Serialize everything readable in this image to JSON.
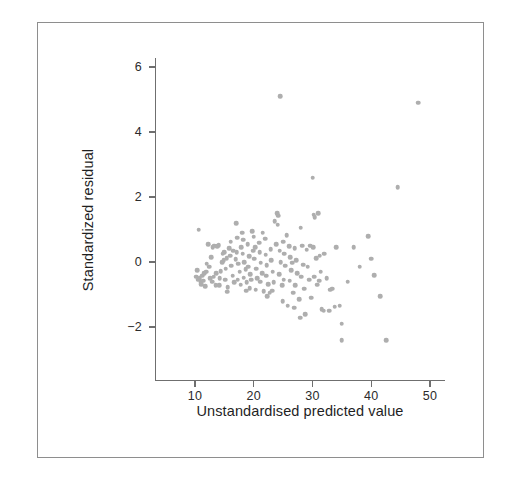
{
  "figure": {
    "frame_color": "#8e8e8e",
    "background": "#ffffff"
  },
  "chart_data": {
    "type": "scatter",
    "title": "",
    "xlabel": "Unstandardised predicted value",
    "ylabel": "Standardized residual",
    "xlim": [
      4.5,
      53
    ],
    "ylim": [
      -3.2,
      6.6
    ],
    "xticks": [
      10,
      20,
      30,
      40,
      50
    ],
    "yticks": [
      -2,
      0,
      2,
      4,
      6
    ],
    "xtick_labels": [
      "10",
      "20",
      "30",
      "40",
      "50"
    ],
    "ytick_labels": [
      "-2",
      "0",
      "2",
      "4",
      "6"
    ],
    "grid": false,
    "legend": null,
    "marker": {
      "shape": "circle",
      "color": "#aeaeae",
      "size_px": 4.6
    },
    "series": [
      {
        "name": "residuals",
        "n_points": 163,
        "points": [
          [
            10.6,
            1.0
          ],
          [
            10.4,
            -0.25
          ],
          [
            10.2,
            -0.45
          ],
          [
            10.5,
            -0.55
          ],
          [
            10.8,
            -0.5
          ],
          [
            11.0,
            -0.62
          ],
          [
            11.2,
            -0.42
          ],
          [
            11.4,
            -0.58
          ],
          [
            11.6,
            -0.35
          ],
          [
            11.1,
            -0.68
          ],
          [
            11.9,
            -0.3
          ],
          [
            12.2,
            0.55
          ],
          [
            12.4,
            -0.15
          ],
          [
            12.0,
            -0.05
          ],
          [
            12.6,
            -0.5
          ],
          [
            12.8,
            0.15
          ],
          [
            13.0,
            0.45
          ],
          [
            13.3,
            0.5
          ],
          [
            13.2,
            -0.45
          ],
          [
            13.6,
            -0.35
          ],
          [
            13.8,
            0.48
          ],
          [
            14.0,
            0.52
          ],
          [
            14.2,
            -0.5
          ],
          [
            14.4,
            -0.28
          ],
          [
            14.6,
            0.0
          ],
          [
            14.1,
            -0.72
          ],
          [
            14.9,
            0.05
          ],
          [
            15.0,
            0.3
          ],
          [
            15.2,
            -0.2
          ],
          [
            15.4,
            0.12
          ],
          [
            15.1,
            -0.55
          ],
          [
            15.6,
            -0.78
          ],
          [
            15.8,
            0.42
          ],
          [
            16.0,
            0.2
          ],
          [
            16.2,
            -0.12
          ],
          [
            16.4,
            -0.42
          ],
          [
            16.1,
            0.62
          ],
          [
            16.7,
            -0.62
          ],
          [
            16.9,
            0.08
          ],
          [
            17.0,
            1.2
          ],
          [
            17.2,
            0.75
          ],
          [
            17.1,
            0.3
          ],
          [
            17.4,
            -0.05
          ],
          [
            17.6,
            -0.3
          ],
          [
            17.3,
            -0.55
          ],
          [
            17.8,
            -0.7
          ],
          [
            18.0,
            0.9
          ],
          [
            18.2,
            0.68
          ],
          [
            18.1,
            0.25
          ],
          [
            18.4,
            0.0
          ],
          [
            18.6,
            -0.22
          ],
          [
            18.3,
            -0.48
          ],
          [
            18.8,
            -0.62
          ],
          [
            19.0,
            0.55
          ],
          [
            19.2,
            0.18
          ],
          [
            19.1,
            -0.15
          ],
          [
            19.4,
            -0.38
          ],
          [
            19.6,
            -0.55
          ],
          [
            19.3,
            -0.8
          ],
          [
            19.9,
            0.35
          ],
          [
            20.0,
            0.78
          ],
          [
            20.2,
            0.45
          ],
          [
            20.1,
            0.1
          ],
          [
            20.4,
            -0.2
          ],
          [
            20.6,
            -0.5
          ],
          [
            20.3,
            -0.85
          ],
          [
            20.9,
            0.6
          ],
          [
            21.0,
            0.3
          ],
          [
            21.2,
            -0.02
          ],
          [
            21.4,
            -0.35
          ],
          [
            21.1,
            -0.6
          ],
          [
            21.7,
            -0.9
          ],
          [
            21.9,
            0.72
          ],
          [
            22.0,
            0.22
          ],
          [
            22.2,
            -0.1
          ],
          [
            22.1,
            -0.42
          ],
          [
            22.5,
            -0.68
          ],
          [
            22.7,
            -0.95
          ],
          [
            22.9,
            0.4
          ],
          [
            23.0,
            0.05
          ],
          [
            23.2,
            -0.3
          ],
          [
            23.4,
            -0.62
          ],
          [
            23.1,
            -0.88
          ],
          [
            23.8,
            0.55
          ],
          [
            24.0,
            1.5
          ],
          [
            24.2,
            1.42
          ],
          [
            24.1,
            1.15
          ],
          [
            24.4,
            0.35
          ],
          [
            24.6,
            0.0
          ],
          [
            24.3,
            -0.38
          ],
          [
            24.8,
            -0.72
          ],
          [
            24.5,
            5.1
          ],
          [
            25.0,
            0.62
          ],
          [
            25.2,
            0.25
          ],
          [
            25.4,
            -0.12
          ],
          [
            25.1,
            -0.55
          ],
          [
            25.8,
            -1.35
          ],
          [
            26.0,
            0.48
          ],
          [
            26.2,
            0.15
          ],
          [
            26.4,
            -0.25
          ],
          [
            26.1,
            -0.58
          ],
          [
            26.7,
            -0.95
          ],
          [
            26.9,
            -1.4
          ],
          [
            27.0,
            0.42
          ],
          [
            27.2,
            0.05
          ],
          [
            27.4,
            -0.35
          ],
          [
            27.1,
            -0.72
          ],
          [
            27.7,
            -1.15
          ],
          [
            27.9,
            -1.72
          ],
          [
            28.0,
            1.05
          ],
          [
            28.2,
            0.5
          ],
          [
            28.4,
            -0.08
          ],
          [
            28.1,
            -0.45
          ],
          [
            28.6,
            -0.82
          ],
          [
            28.8,
            -1.6
          ],
          [
            29.0,
            0.38
          ],
          [
            29.2,
            -0.15
          ],
          [
            29.4,
            -0.55
          ],
          [
            29.8,
            -1.1
          ],
          [
            30.0,
            2.6
          ],
          [
            30.2,
            1.45
          ],
          [
            30.4,
            1.38
          ],
          [
            30.1,
            0.45
          ],
          [
            30.6,
            0.12
          ],
          [
            30.3,
            -0.45
          ],
          [
            30.8,
            -0.7
          ],
          [
            31.0,
            1.5
          ],
          [
            31.2,
            0.2
          ],
          [
            31.4,
            -0.3
          ],
          [
            31.1,
            -0.58
          ],
          [
            31.6,
            -1.45
          ],
          [
            31.9,
            -1.5
          ],
          [
            32.0,
            0.25
          ],
          [
            32.4,
            -0.5
          ],
          [
            32.8,
            -1.5
          ],
          [
            33.0,
            -0.85
          ],
          [
            33.4,
            -0.82
          ],
          [
            34.0,
            0.45
          ],
          [
            34.6,
            -1.35
          ],
          [
            35.0,
            -1.9
          ],
          [
            35.0,
            -2.4
          ],
          [
            36.0,
            -0.6
          ],
          [
            37.0,
            0.45
          ],
          [
            38.0,
            -0.15
          ],
          [
            39.5,
            0.8
          ],
          [
            40.0,
            0.1
          ],
          [
            40.5,
            -0.4
          ],
          [
            41.5,
            -1.05
          ],
          [
            42.5,
            -2.4
          ],
          [
            44.5,
            2.3
          ],
          [
            48.0,
            4.9
          ],
          [
            21.5,
            0.9
          ],
          [
            19.7,
            0.95
          ],
          [
            17.9,
            0.45
          ],
          [
            16.5,
            0.35
          ],
          [
            14.7,
            0.25
          ],
          [
            12.9,
            -0.6
          ],
          [
            23.6,
            1.25
          ],
          [
            25.6,
            0.82
          ],
          [
            29.6,
            0.5
          ],
          [
            33.8,
            -1.38
          ],
          [
            26.5,
            -0.02
          ],
          [
            22.3,
            -1.05
          ],
          [
            18.7,
            -0.88
          ],
          [
            15.5,
            -0.92
          ],
          [
            13.5,
            -0.72
          ],
          [
            11.7,
            -0.75
          ],
          [
            24.9,
            -1.2
          ]
        ]
      }
    ]
  }
}
